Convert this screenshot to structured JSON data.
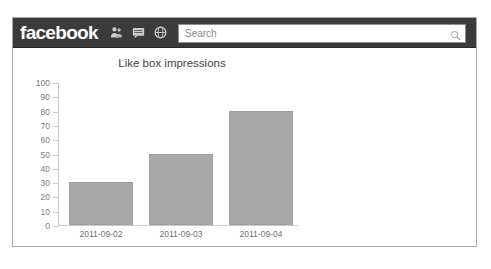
{
  "header": {
    "brand": "facebook",
    "icons": [
      {
        "name": "friend-requests-icon",
        "label": "Friend requests"
      },
      {
        "name": "messages-icon",
        "label": "Messages"
      },
      {
        "name": "notifications-globe-icon",
        "label": "Notifications"
      }
    ],
    "search": {
      "placeholder": "Search",
      "value": "",
      "icon": "search-icon"
    }
  },
  "chart_data": {
    "type": "bar",
    "title": "Like box impressions",
    "categories": [
      "2011-09-02",
      "2011-09-03",
      "2011-09-04"
    ],
    "values": [
      30,
      50,
      80
    ],
    "xlabel": "",
    "ylabel": "",
    "ylim": [
      0,
      100
    ],
    "yticks": [
      0,
      10,
      20,
      30,
      40,
      50,
      60,
      70,
      80,
      90,
      100
    ],
    "grid": false,
    "legend": false,
    "bar_color": "#a9a9a9"
  },
  "colors": {
    "header_bg": "#3b3b3b",
    "panel_bg": "#ffffff",
    "panel_border": "#a9a9a9",
    "axis": "#c9c9c9",
    "tick_text": "#7d7d7d"
  }
}
